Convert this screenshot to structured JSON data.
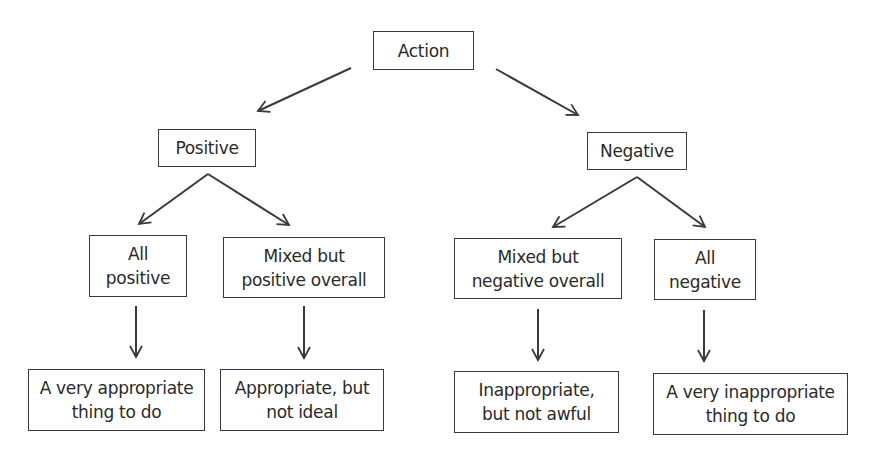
{
  "diagram": {
    "type": "tree",
    "nodes": {
      "root": {
        "label": "Action"
      },
      "positive": {
        "label": "Positive"
      },
      "negative": {
        "label": "Negative"
      },
      "all_positive": {
        "line1": "All",
        "line2": "positive"
      },
      "mixed_positive": {
        "line1": "Mixed but",
        "line2": "positive overall"
      },
      "mixed_negative": {
        "line1": "Mixed but",
        "line2": "negative overall"
      },
      "all_negative": {
        "line1": "All",
        "line2": "negative"
      },
      "very_appropriate": {
        "line1": "A very appropriate",
        "line2": "thing to do"
      },
      "appropriate": {
        "line1": "Appropriate, but",
        "line2": "not ideal"
      },
      "inappropriate": {
        "line1": "Inappropriate,",
        "line2": "but not awful"
      },
      "very_inappropriate": {
        "line1": "A very inappropriate",
        "line2": "thing to do"
      }
    },
    "edges": [
      [
        "root",
        "positive"
      ],
      [
        "root",
        "negative"
      ],
      [
        "positive",
        "all_positive"
      ],
      [
        "positive",
        "mixed_positive"
      ],
      [
        "negative",
        "mixed_negative"
      ],
      [
        "negative",
        "all_negative"
      ],
      [
        "all_positive",
        "very_appropriate"
      ],
      [
        "mixed_positive",
        "appropriate"
      ],
      [
        "mixed_negative",
        "inappropriate"
      ],
      [
        "all_negative",
        "very_inappropriate"
      ]
    ],
    "colors": {
      "stroke": "#3a3a3a",
      "text": "#2a2a2a",
      "background": "#ffffff"
    }
  }
}
